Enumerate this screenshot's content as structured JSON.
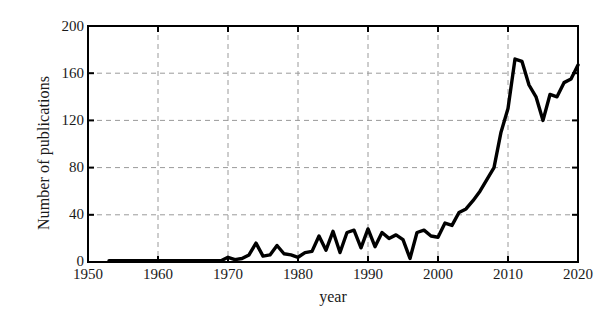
{
  "chart_data": {
    "type": "line",
    "title": "",
    "xlabel": "year",
    "ylabel": "Number of publications",
    "xlim": [
      1950,
      2020
    ],
    "ylim": [
      0,
      200
    ],
    "grid": true,
    "legend": null,
    "xticks": [
      1950,
      1960,
      1970,
      1980,
      1990,
      2000,
      2010,
      2020
    ],
    "yticks": [
      0,
      40,
      80,
      120,
      160,
      200
    ],
    "series": [
      {
        "name": "Number of publications",
        "color": "#000000",
        "x": [
          1953,
          1954,
          1955,
          1956,
          1957,
          1958,
          1959,
          1960,
          1961,
          1962,
          1963,
          1964,
          1965,
          1966,
          1967,
          1968,
          1969,
          1970,
          1971,
          1972,
          1973,
          1974,
          1975,
          1976,
          1977,
          1978,
          1979,
          1980,
          1981,
          1982,
          1983,
          1984,
          1985,
          1986,
          1987,
          1988,
          1989,
          1990,
          1991,
          1992,
          1993,
          1994,
          1995,
          1996,
          1997,
          1998,
          1999,
          2000,
          2001,
          2002,
          2003,
          2004,
          2005,
          2006,
          2007,
          2008,
          2009,
          2010,
          2011,
          2012,
          2013,
          2014,
          2015,
          2016,
          2017,
          2018,
          2019,
          2020
        ],
        "values": [
          1,
          1,
          1,
          1,
          1,
          1,
          1,
          1,
          1,
          1,
          1,
          1,
          1,
          1,
          1,
          1,
          1,
          4,
          2,
          3,
          6,
          16,
          5,
          6,
          14,
          7,
          6,
          4,
          8,
          9,
          22,
          10,
          26,
          8,
          25,
          27,
          12,
          28,
          13,
          25,
          20,
          23,
          19,
          3,
          25,
          27,
          22,
          21,
          33,
          31,
          42,
          45,
          52,
          60,
          70,
          80,
          110,
          130,
          172,
          170,
          150,
          140,
          120,
          142,
          140,
          152,
          155,
          167
        ]
      }
    ]
  },
  "axes": {
    "y_tick_labels": [
      "200",
      "160",
      "120",
      "80",
      "40",
      "0"
    ],
    "x_tick_labels": [
      "1950",
      "1960",
      "1970",
      "1980",
      "1990",
      "2000",
      "2010",
      "2020"
    ]
  }
}
